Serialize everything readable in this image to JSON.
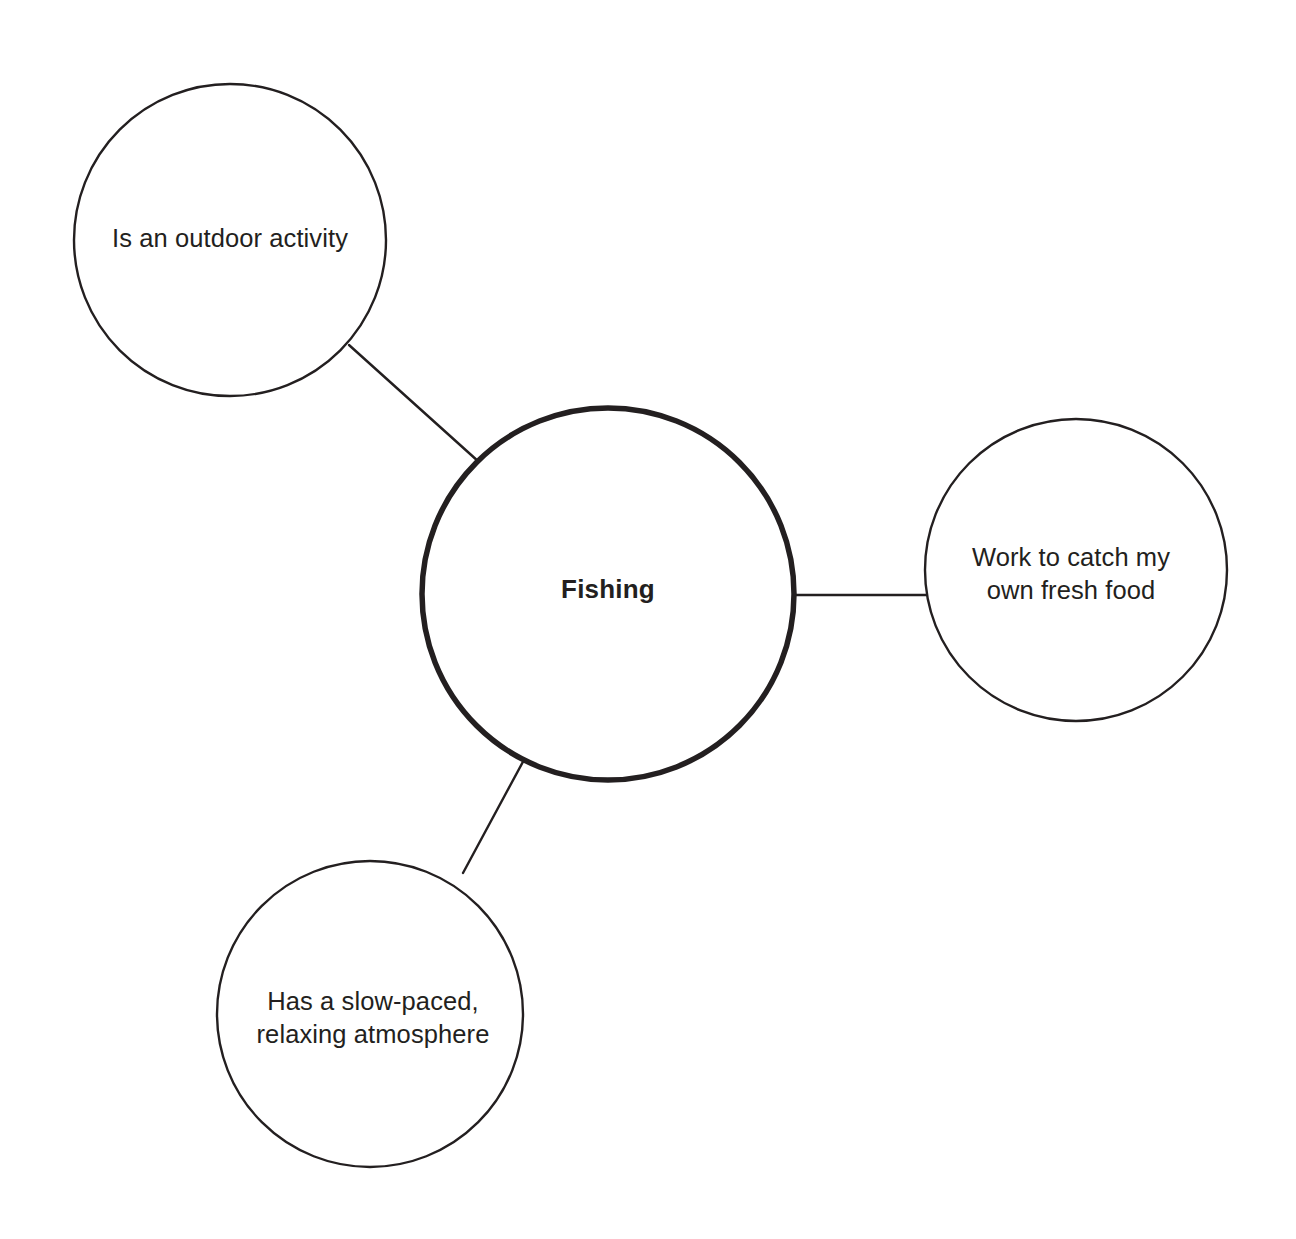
{
  "diagram": {
    "type": "concept-map",
    "background_color": "#ffffff",
    "stroke_color": "#231f20",
    "text_color": "#231f20",
    "central_node": {
      "id": "fishing",
      "label": "Fishing",
      "cx": 608,
      "cy": 594,
      "r": 186,
      "stroke_width": 5.5,
      "font_weight": "bold"
    },
    "satellite_nodes": [
      {
        "id": "outdoor-activity",
        "label": "Is an outdoor activity",
        "cx": 230,
        "cy": 240,
        "r": 156,
        "stroke_width": 2.4,
        "label_lines": "Is an outdoor activity",
        "label_cx": 230,
        "label_cy": 239
      },
      {
        "id": "fresh-food",
        "label": "Work to catch my own fresh food",
        "cx": 1076,
        "cy": 570,
        "r": 151,
        "stroke_width": 2.4,
        "label_lines": "Work to catch my\nown fresh food",
        "label_cx": 1071,
        "label_cy": 574
      },
      {
        "id": "relaxing-atmosphere",
        "label": "Has a slow-paced, relaxing atmosphere",
        "cx": 370,
        "cy": 1014,
        "r": 153,
        "stroke_width": 2.4,
        "label_lines": "Has a slow-paced,\nrelaxing atmosphere",
        "label_cx": 373,
        "label_cy": 1018
      }
    ],
    "connectors": [
      {
        "id": "connector-outdoor-activity",
        "from": "outdoor-activity",
        "to": "fishing",
        "x1": 349,
        "y1": 345,
        "x2": 479,
        "y2": 462,
        "stroke_width": 2.4
      },
      {
        "id": "connector-fresh-food",
        "from": "fishing",
        "to": "fresh-food",
        "x1": 793,
        "y1": 595,
        "x2": 927,
        "y2": 595,
        "stroke_width": 2.4
      },
      {
        "id": "connector-relaxing-atmosphere",
        "from": "fishing",
        "to": "relaxing-atmosphere",
        "x1": 463,
        "y1": 873,
        "x2": 525,
        "y2": 758,
        "stroke_width": 2.4
      }
    ]
  }
}
